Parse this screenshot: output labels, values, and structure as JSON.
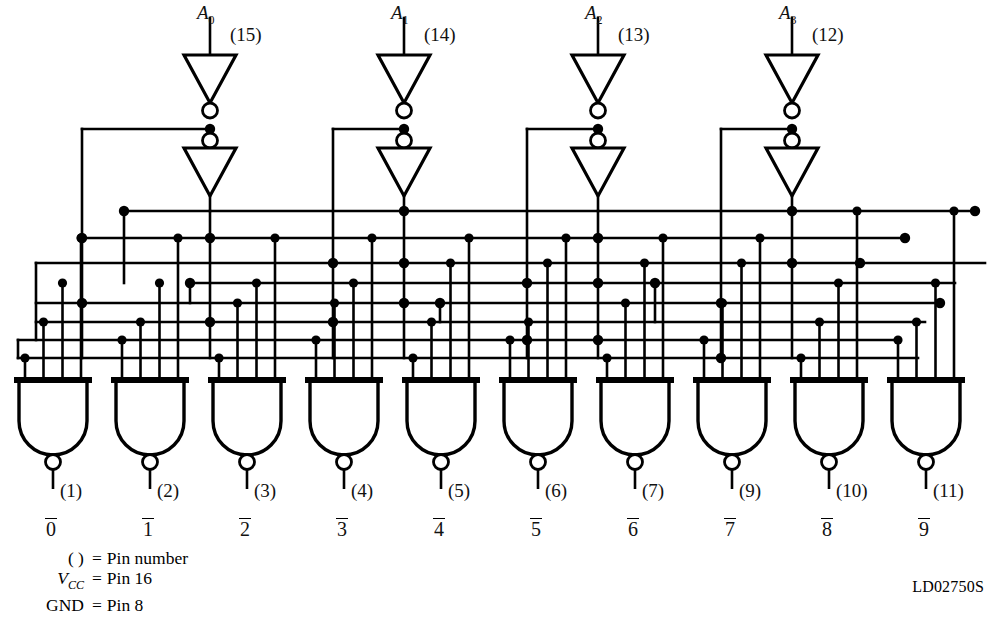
{
  "figure": {
    "doc_id": "LD02750S",
    "type": "BCD-to-decimal decoder logic diagram"
  },
  "inputs": [
    {
      "name": "A",
      "sub": "0",
      "pin": "(15)",
      "x": 210
    },
    {
      "name": "A",
      "sub": "1",
      "pin": "(14)",
      "x": 404
    },
    {
      "name": "A",
      "sub": "2",
      "pin": "(13)",
      "x": 598
    },
    {
      "name": "A",
      "sub": "3",
      "pin": "(12)",
      "x": 792
    }
  ],
  "outputs": [
    {
      "label": "0",
      "pin": "(1)",
      "x": 53
    },
    {
      "label": "1",
      "pin": "(2)",
      "x": 150
    },
    {
      "label": "2",
      "pin": "(3)",
      "x": 247
    },
    {
      "label": "3",
      "pin": "(4)",
      "x": 344
    },
    {
      "label": "4",
      "pin": "(5)",
      "x": 441
    },
    {
      "label": "5",
      "pin": "(6)",
      "x": 538
    },
    {
      "label": "6",
      "pin": "(7)",
      "x": 635
    },
    {
      "label": "7",
      "pin": "(9)",
      "x": 732
    },
    {
      "label": "8",
      "pin": "(10)",
      "x": 829
    },
    {
      "label": "9",
      "pin": "(11)",
      "x": 926
    }
  ],
  "legend": [
    {
      "key": "( )",
      "eq": "=",
      "value": "Pin number",
      "italic": false
    },
    {
      "key": "VCC",
      "eq": "=",
      "value": "Pin 16",
      "italic": true
    },
    {
      "key": "GND",
      "eq": "=",
      "value": "Pin 8",
      "italic": false
    }
  ],
  "colors": {
    "line": "#000000",
    "background": "#ffffff"
  },
  "chart_data": {
    "type": "diagram",
    "gate_count": 10,
    "inverter_pairs": 4,
    "bus_rows_y": [
      211,
      238,
      263,
      283,
      303,
      322,
      340,
      358
    ],
    "gate_truth": [
      {
        "out": "0",
        "inputs": [
          "A3'",
          "A2'",
          "A1'",
          "A0'"
        ]
      },
      {
        "out": "1",
        "inputs": [
          "A3'",
          "A2'",
          "A1'",
          "A0"
        ]
      },
      {
        "out": "2",
        "inputs": [
          "A3'",
          "A2'",
          "A1",
          "A0'"
        ]
      },
      {
        "out": "3",
        "inputs": [
          "A3'",
          "A2'",
          "A1",
          "A0"
        ]
      },
      {
        "out": "4",
        "inputs": [
          "A3'",
          "A2",
          "A1'",
          "A0'"
        ]
      },
      {
        "out": "5",
        "inputs": [
          "A3'",
          "A2",
          "A1'",
          "A0"
        ]
      },
      {
        "out": "6",
        "inputs": [
          "A3'",
          "A2",
          "A1",
          "A0'"
        ]
      },
      {
        "out": "7",
        "inputs": [
          "A3'",
          "A2",
          "A1",
          "A0"
        ]
      },
      {
        "out": "8",
        "inputs": [
          "A3",
          "A2'",
          "A1'",
          "A0'"
        ]
      },
      {
        "out": "9",
        "inputs": [
          "A3",
          "A2'",
          "A1'",
          "A0"
        ]
      }
    ]
  }
}
